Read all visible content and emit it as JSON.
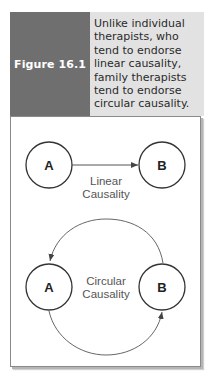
{
  "figure": {
    "label": "Figure 16.1",
    "caption": "Unlike individual therapists, who tend to endorse linear causality, family therapists tend to endorse circular causality.",
    "colors": {
      "label_panel": "#6f6f6f",
      "caption_panel": "#e2e2e2",
      "label_text": "#ffffff"
    }
  },
  "diagram": {
    "linear": {
      "node_a": "A",
      "node_b": "B",
      "label_line1": "Linear",
      "label_line2": "Causality"
    },
    "circular": {
      "node_a": "A",
      "node_b": "B",
      "label_line1": "Circular",
      "label_line2": "Causality"
    }
  }
}
